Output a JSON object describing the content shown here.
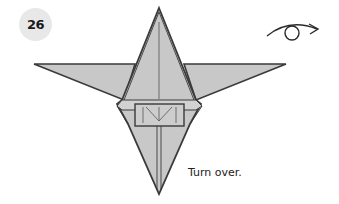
{
  "step": {
    "number": "26"
  },
  "caption": {
    "text": "Turn over."
  },
  "symbols": {
    "turn_over": "turn-over-arrow-icon"
  },
  "colors": {
    "paper_fill": "#c8c8c8",
    "outline": "#3a3a3a",
    "badge_bg": "#e8e8e8"
  }
}
